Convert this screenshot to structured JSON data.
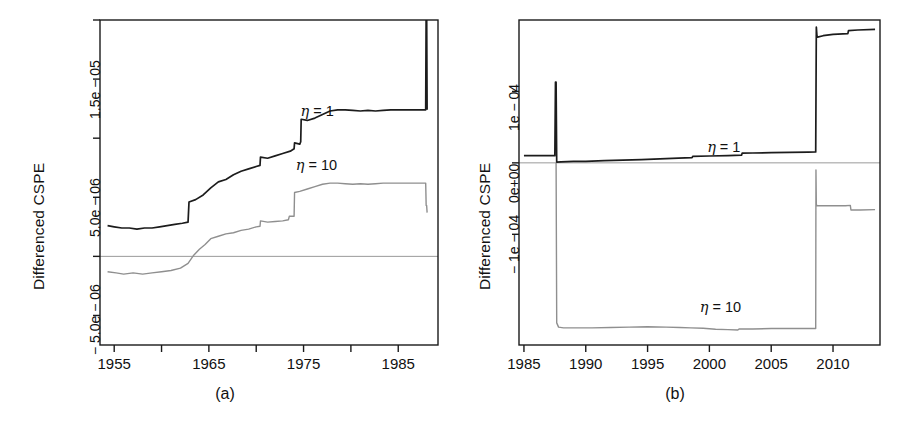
{
  "figure": {
    "panels": [
      {
        "id": "a",
        "caption": "(a)",
        "ylabel": "Differenced CSPE",
        "series_labels": [
          {
            "name": "eta-1",
            "text_prefix": "η",
            "text_suffix": " = 1"
          },
          {
            "name": "eta-10",
            "text_prefix": "η",
            "text_suffix": " = 10"
          }
        ]
      },
      {
        "id": "b",
        "caption": "(b)",
        "ylabel": "Differenced CSPE",
        "series_labels": [
          {
            "name": "eta-1",
            "text_prefix": "η",
            "text_suffix": " = 1"
          },
          {
            "name": "eta-10",
            "text_prefix": "η",
            "text_suffix": " = 10"
          }
        ]
      }
    ]
  },
  "colors": {
    "eta1": "#1c1c1c",
    "eta10": "#8f8f8f",
    "axis": "#1a1a1a",
    "zero_line": "#9a9a9a",
    "background": "#ffffff"
  },
  "chart_data": [
    {
      "type": "line",
      "panel": "a",
      "title": "",
      "subtitle": "",
      "xlabel": "",
      "ylabel": "Differenced CSPE",
      "caption": "(a)",
      "grid": false,
      "legend_position": "inline-annotation",
      "zero_reference_line": 0,
      "xlim": [
        1953.5,
        1989.2
      ],
      "ylim": [
        -7.5e-06,
        2e-05
      ],
      "xticks": [
        1955,
        1960,
        1965,
        1970,
        1975,
        1980,
        1985
      ],
      "xtick_labels": [
        "1955",
        "",
        "1965",
        "",
        "1975",
        "",
        "1985"
      ],
      "yticks": [
        -5e-06,
        0,
        5e-06,
        1e-05,
        1.5e-05,
        2e-05
      ],
      "ytick_labels": [
        "-5.0e-06",
        "",
        "5.0e-06",
        "",
        "1.5e-05",
        ""
      ],
      "series": [
        {
          "name": "η = 1",
          "color": "#1c1c1c",
          "annotation": "η = 1",
          "annotation_x": 1977.0,
          "annotation_y": 1.21e-05,
          "x": [
            1954.3,
            1955.0,
            1955.8,
            1956.6,
            1957.4,
            1958.2,
            1959.0,
            1959.8,
            1960.6,
            1961.4,
            1962.2,
            1962.8,
            1962.9,
            1963.6,
            1964.4,
            1965.2,
            1966.0,
            1966.8,
            1967.6,
            1968.4,
            1969.2,
            1970.0,
            1970.4,
            1970.45,
            1971.2,
            1972.0,
            1972.8,
            1973.6,
            1974.0,
            1974.05,
            1974.6,
            1974.7,
            1974.75,
            1975.4,
            1976.2,
            1977.0,
            1977.8,
            1978.6,
            1979.4,
            1980.2,
            1981.0,
            1981.8,
            1982.6,
            1983.4,
            1984.2,
            1985.0,
            1985.8,
            1986.6,
            1987.4,
            1987.9,
            1987.95,
            1988.0,
            1988.05
          ],
          "y": [
            2.6e-06,
            2.5e-06,
            2.4e-06,
            2.4e-06,
            2.3e-06,
            2.4e-06,
            2.4e-06,
            2.5e-06,
            2.6e-06,
            2.7e-06,
            2.8e-06,
            2.9e-06,
            4.6e-06,
            4.8e-06,
            5.2e-06,
            5.8e-06,
            6.3e-06,
            6.5e-06,
            6.9e-06,
            7.2e-06,
            7.4e-06,
            7.6e-06,
            7.7e-06,
            8.4e-06,
            8.3e-06,
            8.5e-06,
            8.7e-06,
            8.9e-06,
            9.1e-06,
            9.6e-06,
            9.5e-06,
            9.7e-06,
            1.16e-05,
            1.15e-05,
            1.17e-05,
            1.2e-05,
            1.23e-05,
            1.24e-05,
            1.24e-05,
            1.235e-05,
            1.23e-05,
            1.235e-05,
            1.23e-05,
            1.235e-05,
            1.24e-05,
            1.24e-05,
            1.24e-05,
            1.24e-05,
            1.24e-05,
            1.24e-05,
            2.1e-05,
            2.1e-05,
            1.24e-05
          ],
          "notes": "rises in steps; large off-scale vertical spike near 1988"
        },
        {
          "name": "η = 10",
          "color": "#8f8f8f",
          "annotation": "η = 10",
          "annotation_x": 1976.5,
          "annotation_y": 7.6e-06,
          "x": [
            1954.3,
            1955.2,
            1956.0,
            1957.0,
            1958.0,
            1959.0,
            1960.0,
            1961.0,
            1962.0,
            1962.8,
            1963.4,
            1964.0,
            1964.6,
            1965.2,
            1966.0,
            1966.8,
            1967.6,
            1968.4,
            1969.2,
            1970.0,
            1970.4,
            1970.45,
            1971.2,
            1972.0,
            1972.8,
            1973.4,
            1973.5,
            1974.0,
            1974.05,
            1974.6,
            1975.4,
            1976.2,
            1977.0,
            1977.8,
            1978.6,
            1979.4,
            1980.2,
            1981.0,
            1981.8,
            1982.6,
            1983.4,
            1984.2,
            1985.0,
            1985.8,
            1986.6,
            1987.4,
            1987.9,
            1987.95,
            1988.0,
            1988.05
          ],
          "y": [
            -1.3e-06,
            -1.4e-06,
            -1.5e-06,
            -1.4e-06,
            -1.5e-06,
            -1.4e-06,
            -1.3e-06,
            -1.2e-06,
            -1e-06,
            -6e-07,
            1e-07,
            6e-07,
            1e-06,
            1.5e-06,
            1.7e-06,
            1.9e-06,
            2e-06,
            2.2e-06,
            2.3e-06,
            2.5e-06,
            2.55e-06,
            3e-06,
            2.9e-06,
            2.95e-06,
            3e-06,
            3.1e-06,
            3.4e-06,
            3.4e-06,
            5.4e-06,
            5.5e-06,
            5.7e-06,
            5.9e-06,
            6.1e-06,
            6.2e-06,
            6.2e-06,
            6.15e-06,
            6.1e-06,
            6.15e-06,
            6.1e-06,
            6.15e-06,
            6.2e-06,
            6.2e-06,
            6.2e-06,
            6.2e-06,
            6.2e-06,
            6.2e-06,
            6.2e-06,
            4.3e-06,
            4.3e-06,
            3.7e-06
          ],
          "notes": "starts negative, crosses zero near 1963, plateaus; drops at 1988 spike"
        }
      ]
    },
    {
      "type": "line",
      "panel": "b",
      "title": "",
      "subtitle": "",
      "xlabel": "",
      "ylabel": "Differenced CSPE",
      "caption": "(b)",
      "grid": false,
      "legend_position": "inline-annotation",
      "zero_reference_line": 0,
      "xlim": [
        1984.6,
        2013.8
      ],
      "ylim": [
        -0.000255,
        0.0002
      ],
      "xticks": [
        1985,
        1990,
        1995,
        2000,
        2005,
        2010
      ],
      "xtick_labels": [
        "1985",
        "1990",
        "1995",
        "2000",
        "2005",
        "2010"
      ],
      "yticks": [
        -0.0001,
        0.0,
        0.0001
      ],
      "ytick_labels": [
        "-1e-04",
        "0e+00",
        "1e-04"
      ],
      "series": [
        {
          "name": "η = 1",
          "color": "#1c1c1c",
          "annotation": "η = 1",
          "annotation_x": 2001.6,
          "annotation_y": 2e-05,
          "x": [
            1985.0,
            1986.0,
            1987.0,
            1987.5,
            1987.55,
            1987.6,
            1987.65,
            1988.0,
            1989.0,
            1990.0,
            1991.5,
            1993.0,
            1994.5,
            1996.0,
            1997.5,
            1998.6,
            1998.65,
            2000.0,
            2001.5,
            2002.6,
            2002.65,
            2003.5,
            2005.0,
            2006.5,
            2008.0,
            2008.6,
            2008.65,
            2008.7,
            2008.75,
            2009.2,
            2010.0,
            2011.2,
            2011.25,
            2012.0,
            2013.4
          ],
          "y": [
            1e-05,
            1e-05,
            1e-05,
            1e-05,
            0.000113,
            0.000113,
            1e-06,
            1.5e-06,
            2e-06,
            2.2e-06,
            3e-06,
            3.8e-06,
            4.6e-06,
            5.5e-06,
            6.6e-06,
            7.4e-06,
            9e-06,
            9.6e-06,
            1.02e-05,
            1.08e-05,
            1.35e-05,
            1.38e-05,
            1.42e-05,
            1.46e-05,
            1.5e-05,
            1.52e-05,
            0.00019,
            0.000178,
            0.000176,
            0.000178,
            0.00018,
            0.000181,
            0.000185,
            0.000186,
            0.000187
          ],
          "notes": "narrow tall spike at 1987.6; huge step up at 2008.6"
        },
        {
          "name": "η = 10",
          "color": "#8f8f8f",
          "annotation": "η = 10",
          "annotation_x": 2001.0,
          "annotation_y": -0.000205,
          "x": [
            1987.6,
            1987.65,
            1987.8,
            1988.2,
            1989.0,
            1990.5,
            1992.0,
            1993.5,
            1995.0,
            1996.5,
            1997.6,
            1998.5,
            1999.5,
            2000.5,
            2001.5,
            2002.3,
            2002.4,
            2003.5,
            2005.0,
            2006.5,
            2008.0,
            2008.6,
            2008.62,
            2008.65,
            2008.7,
            2009.0,
            2010.0,
            2011.0,
            2011.4,
            2011.45,
            2012.2,
            2013.4
          ],
          "y": [
            0.0,
            -0.000224,
            -0.00023,
            -0.000231,
            -0.000231,
            -0.000231,
            -0.0002305,
            -0.00023,
            -0.0002295,
            -0.00023,
            -0.0002305,
            -0.000231,
            -0.0002315,
            -0.000233,
            -0.0002335,
            -0.000234,
            -0.0002325,
            -0.0002325,
            -0.000232,
            -0.000232,
            -0.000232,
            -0.000232,
            -1e-05,
            -5.8e-05,
            -6e-05,
            -6e-05,
            -6e-05,
            -6e-05,
            -5.95e-05,
            -6.6e-05,
            -6.6e-05,
            -6.55e-05
          ],
          "notes": "plunges at 1987.6 to about -2.3e-04, recovers partially at 2008.6"
        }
      ]
    }
  ]
}
